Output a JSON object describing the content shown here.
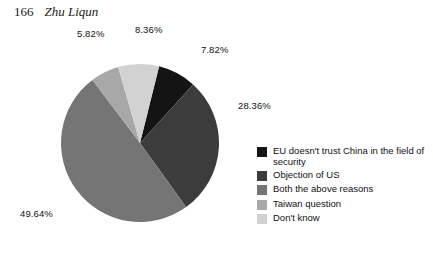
{
  "running_head": {
    "page_number": "166",
    "author": "Zhu Liqun"
  },
  "chart_data": {
    "type": "pie",
    "title": "",
    "legend_position": "right",
    "categories": [
      "EU doesn't trust China in the field of security",
      "Objection of US",
      "Both the above reasons",
      "Taiwan question",
      "Don't know"
    ],
    "values": [
      7.82,
      28.36,
      49.64,
      5.82,
      8.36
    ],
    "value_labels": [
      "7.82%",
      "28.36%",
      "49.64%",
      "5.82%",
      "8.36%"
    ],
    "unit": "%",
    "colors": [
      "#141414",
      "#3c3c3c",
      "#757575",
      "#a8a8a8",
      "#d2d2d2"
    ],
    "start_angle_deg": 14,
    "direction": "clockwise"
  },
  "labels": {
    "slice_1": "7.82%",
    "slice_2": "28.36%",
    "slice_3": "49.64%",
    "slice_4": "5.82%",
    "slice_5": "8.36%"
  },
  "legend": {
    "items": [
      {
        "label": "EU doesn't trust China in the field of security",
        "color": "#141414"
      },
      {
        "label": "Objection of US",
        "color": "#3c3c3c"
      },
      {
        "label": "Both the above reasons",
        "color": "#757575"
      },
      {
        "label": "Taiwan question",
        "color": "#a8a8a8"
      },
      {
        "label": "Don't know",
        "color": "#d2d2d2"
      }
    ]
  }
}
